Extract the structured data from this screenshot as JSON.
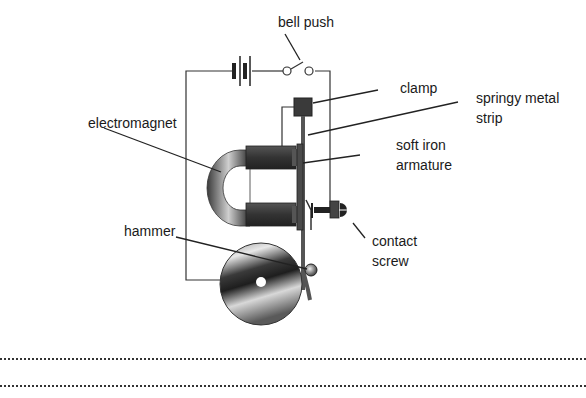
{
  "diagram": {
    "labels": {
      "bell_push": "bell push",
      "clamp": "clamp",
      "springy_metal_strip_line1": "springy metal",
      "springy_metal_strip_line2": "strip",
      "electromagnet": "electromagnet",
      "soft_iron_line1": "soft iron",
      "soft_iron_line2": "armature",
      "hammer": "hammer",
      "contact_screw_line1": "contact",
      "contact_screw_line2": "screw"
    },
    "components": [
      "battery",
      "bell-push switch",
      "clamp",
      "springy metal strip",
      "soft iron armature",
      "electromagnet",
      "contact screw",
      "hammer",
      "gong"
    ]
  },
  "answer_lines": {
    "count": 2
  }
}
